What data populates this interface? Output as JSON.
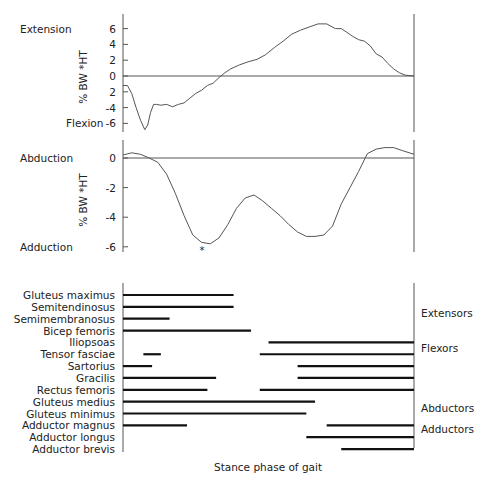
{
  "chart_data": [
    {
      "type": "line",
      "title": "",
      "ylabel": "% BW *HT",
      "xlabel": "",
      "ylim": [
        -7,
        7
      ],
      "yticks": [
        6,
        4,
        2,
        0,
        -2,
        -4,
        -6
      ],
      "ytick_labels": [
        "6",
        "4",
        "2",
        "0",
        "2",
        "-4",
        "-6"
      ],
      "top_label": "Extension",
      "bottom_label": "Flexion",
      "x_range": [
        0,
        100
      ],
      "x": [
        0,
        1.5,
        3,
        4.5,
        6,
        7.5,
        8.5,
        9.5,
        10.5,
        11.5,
        13,
        15,
        17,
        19,
        21,
        23,
        25,
        27,
        29,
        31,
        33,
        35,
        37,
        40,
        43,
        46,
        49,
        52,
        55,
        58,
        61,
        64,
        67,
        70,
        73,
        75,
        77,
        79,
        81,
        83,
        85,
        87,
        89,
        91,
        93,
        95,
        97,
        100
      ],
      "values": [
        -1.2,
        -1.2,
        -2.2,
        -4.0,
        -5.6,
        -6.8,
        -6.2,
        -4.6,
        -3.6,
        -3.6,
        -3.7,
        -3.6,
        -3.9,
        -3.6,
        -3.4,
        -2.8,
        -2.2,
        -1.8,
        -1.2,
        -0.9,
        -0.2,
        0.4,
        0.9,
        1.4,
        1.8,
        2.1,
        2.7,
        3.6,
        4.4,
        5.3,
        5.8,
        6.2,
        6.6,
        6.6,
        6.0,
        6.0,
        5.5,
        5.0,
        4.6,
        4.4,
        3.8,
        2.8,
        2.4,
        1.6,
        0.9,
        0.4,
        0.1,
        0.0
      ]
    },
    {
      "type": "line",
      "title": "",
      "ylabel": "% BW *HT",
      "xlabel": "",
      "ylim": [
        -6.2,
        1.2
      ],
      "yticks": [
        0,
        -2,
        -4,
        -6
      ],
      "ytick_labels": [
        "0",
        "-2",
        "-4",
        "-6"
      ],
      "top_label": "Abduction",
      "bottom_label": "Adduction",
      "annotation": "*",
      "x_range": [
        0,
        100
      ],
      "x": [
        0,
        3,
        6,
        9,
        12,
        15,
        18,
        21,
        24,
        27,
        30,
        33,
        36,
        39,
        42,
        45,
        48,
        51,
        54,
        57,
        60,
        63,
        66,
        69,
        72,
        75,
        78,
        81,
        84,
        87,
        90,
        93,
        96,
        100
      ],
      "values": [
        0.2,
        0.35,
        0.25,
        0.0,
        -0.3,
        -1.1,
        -2.4,
        -3.9,
        -5.2,
        -5.7,
        -5.8,
        -5.4,
        -4.5,
        -3.4,
        -2.7,
        -2.5,
        -2.9,
        -3.4,
        -3.9,
        -4.5,
        -5.0,
        -5.3,
        -5.3,
        -5.2,
        -4.6,
        -3.1,
        -2.0,
        -0.9,
        0.3,
        0.6,
        0.7,
        0.7,
        0.5,
        0.25
      ]
    },
    {
      "type": "bar",
      "subtype": "timeline",
      "xlabel": "Stance phase of gait",
      "x_range": [
        0,
        100
      ],
      "categories": [
        "Gluteus maximus",
        "Semitendinosus",
        "Semimembranosus",
        "Bicep femoris",
        "Iliopsoas",
        "Tensor fasciae",
        "Sartorius",
        "Gracilis",
        "Rectus femoris",
        "Gluteus medius",
        "Gluteus minimus",
        "Adductor magnus",
        "Adductor longus",
        "Adductor brevis"
      ],
      "series": [
        {
          "name": "Gluteus maximus",
          "intervals": [
            [
              0,
              38
            ]
          ]
        },
        {
          "name": "Semitendinosus",
          "intervals": [
            [
              0,
              38
            ]
          ]
        },
        {
          "name": "Semimembranosus",
          "intervals": [
            [
              0,
              16
            ]
          ]
        },
        {
          "name": "Bicep femoris",
          "intervals": [
            [
              0,
              44
            ]
          ]
        },
        {
          "name": "Iliopsoas",
          "intervals": [
            [
              50,
              100
            ]
          ]
        },
        {
          "name": "Tensor fasciae",
          "intervals": [
            [
              7,
              13
            ],
            [
              47,
              100
            ]
          ]
        },
        {
          "name": "Sartorius",
          "intervals": [
            [
              0,
              10
            ],
            [
              60,
              100
            ]
          ]
        },
        {
          "name": "Gracilis",
          "intervals": [
            [
              0,
              32
            ],
            [
              60,
              100
            ]
          ]
        },
        {
          "name": "Rectus femoris",
          "intervals": [
            [
              0,
              29
            ],
            [
              47,
              100
            ]
          ]
        },
        {
          "name": "Gluteus medius",
          "intervals": [
            [
              0,
              66
            ]
          ]
        },
        {
          "name": "Gluteus minimus",
          "intervals": [
            [
              0,
              63
            ]
          ]
        },
        {
          "name": "Adductor magnus",
          "intervals": [
            [
              0,
              22
            ],
            [
              70,
              100
            ]
          ]
        },
        {
          "name": "Adductor longus",
          "intervals": [
            [
              63,
              100
            ]
          ]
        },
        {
          "name": "Adductor brevis",
          "intervals": [
            [
              75,
              100
            ]
          ]
        }
      ],
      "group_labels": [
        {
          "label": "Extensors",
          "row": 1.5
        },
        {
          "label": "Flexors",
          "row": 4.5
        },
        {
          "label": "Abductors",
          "row": 9.5
        },
        {
          "label": "Adductors",
          "row": 11.3
        }
      ]
    }
  ]
}
